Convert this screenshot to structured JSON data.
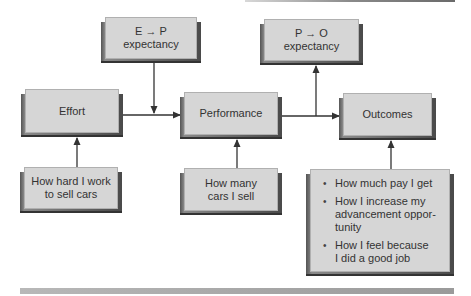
{
  "diagram": {
    "nodes": {
      "ep_expectancy": {
        "line1": "E → P",
        "line2": "expectancy"
      },
      "po_expectancy": {
        "line1": "P → O",
        "line2": "expectancy"
      },
      "effort": {
        "label": "Effort"
      },
      "performance": {
        "label": "Performance"
      },
      "outcomes": {
        "label": "Outcomes"
      },
      "effort_example": {
        "line1": "How hard I work",
        "line2": "to sell cars"
      },
      "performance_example": {
        "line1": "How many",
        "line2": "cars I sell"
      },
      "outcomes_examples": {
        "items": [
          {
            "line1": "How much pay I get",
            "line2": "",
            "line3": ""
          },
          {
            "line1": "How I increase my",
            "line2": "advancement oppor-",
            "line3": "tunity"
          },
          {
            "line1": "How I feel because",
            "line2": "I did a good job",
            "line3": ""
          }
        ]
      }
    },
    "edges": [
      {
        "from": "effort",
        "to": "performance"
      },
      {
        "from": "ep_expectancy",
        "to": "effort-performance-link"
      },
      {
        "from": "performance",
        "to": "outcomes"
      },
      {
        "from": "performance-outcomes-link",
        "to": "po_expectancy"
      },
      {
        "from": "effort_example",
        "to": "effort"
      },
      {
        "from": "performance_example",
        "to": "performance"
      },
      {
        "from": "outcomes_examples",
        "to": "outcomes"
      }
    ],
    "colors": {
      "box_face": "#d6d6d6",
      "box_shadow": "#4a4a4a",
      "arrow": "#333333",
      "rule": "#a8a8a8"
    }
  }
}
